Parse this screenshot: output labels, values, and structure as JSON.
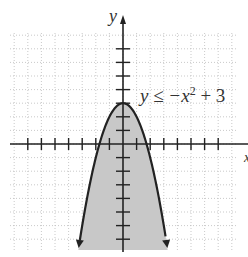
{
  "chart_data": {
    "type": "area",
    "title": "",
    "inequality": "y ≤ −x² + 3",
    "xlabel": "x",
    "ylabel": "y",
    "xlim": [
      -8,
      8.5
    ],
    "ylim": [
      -8,
      8
    ],
    "grid": true,
    "curve": "y = -x^2 + 3",
    "vertex": [
      0,
      3
    ],
    "shaded_region": "below curve",
    "x_ticks": [
      -7,
      -6,
      -5,
      -4,
      -3,
      -2,
      -1,
      1,
      2,
      3,
      4,
      5,
      6,
      7
    ],
    "y_ticks": [
      -7,
      -6,
      -5,
      -4,
      -3,
      -2,
      -1,
      1,
      2,
      3,
      4,
      5,
      6,
      7
    ],
    "colors": {
      "shade": "#c8c8c8",
      "curve": "#222222",
      "grid": "#bbbbbb"
    }
  },
  "labels": {
    "y_axis": "y",
    "x_axis": "x",
    "equation_text": "y ≤ −x",
    "equation_exp": "2",
    "equation_tail": " + 3"
  }
}
